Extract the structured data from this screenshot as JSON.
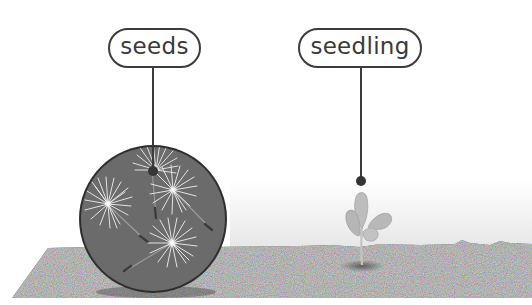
{
  "diagram": {
    "title": "",
    "labels": [
      {
        "id": "seeds",
        "text": "seeds"
      },
      {
        "id": "seedling",
        "text": "seedling"
      }
    ],
    "colors": {
      "outline": "#3c3c3c",
      "label_text": "#3a3a3a",
      "soil": "#6e6e6e",
      "soil_speckle_dark": "#555555",
      "soil_speckle_light": "#8a8a8a",
      "magnifier_fill": "#6b6b6b",
      "magnifier_border": "#2e2e2e",
      "seed_fluff": "#f2f2f2",
      "seedling_leaf": "#b9b9b9",
      "background_band": "#ececec"
    },
    "stages": [
      {
        "name": "seeds",
        "description": "magnified view of dandelion seeds with white pappus on soil"
      },
      {
        "name": "seedling",
        "description": "small plant with four leaves emerging from soil"
      }
    ]
  }
}
